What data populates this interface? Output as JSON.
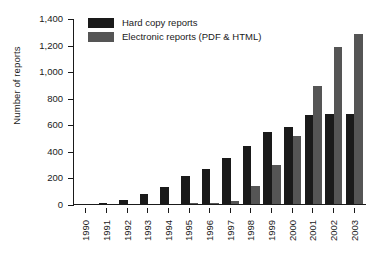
{
  "chart_data": {
    "type": "bar",
    "title": "",
    "xlabel": "",
    "ylabel": "Number of reports",
    "ylim": [
      0,
      1400
    ],
    "yticks": [
      "0",
      "200",
      "400",
      "600",
      "800",
      "1,000",
      "1,200",
      "1,400"
    ],
    "ytick_values": [
      0,
      200,
      400,
      600,
      800,
      1000,
      1200,
      1400
    ],
    "grid": false,
    "legend_position": "top-left",
    "categories": [
      "1990",
      "1991",
      "1992",
      "1993",
      "1994",
      "1995",
      "1996",
      "1997",
      "1998",
      "1999",
      "2000",
      "2001",
      "2002",
      "2003"
    ],
    "series": [
      {
        "name": "Hard copy reports",
        "color": "#1a1a1a",
        "values": [
          3,
          8,
          30,
          75,
          125,
          210,
          265,
          345,
          435,
          545,
          580,
          670,
          675,
          680
        ]
      },
      {
        "name": "Electronic reports (PDF & HTML)",
        "color": "#555555",
        "values": [
          0,
          0,
          0,
          0,
          0,
          5,
          8,
          20,
          135,
          295,
          510,
          890,
          1180,
          1280
        ]
      }
    ]
  },
  "legend": {
    "items": [
      {
        "label": "Hard copy reports",
        "color": "#1a1a1a"
      },
      {
        "label": "Electronic reports (PDF & HTML)",
        "color": "#555555"
      }
    ]
  }
}
